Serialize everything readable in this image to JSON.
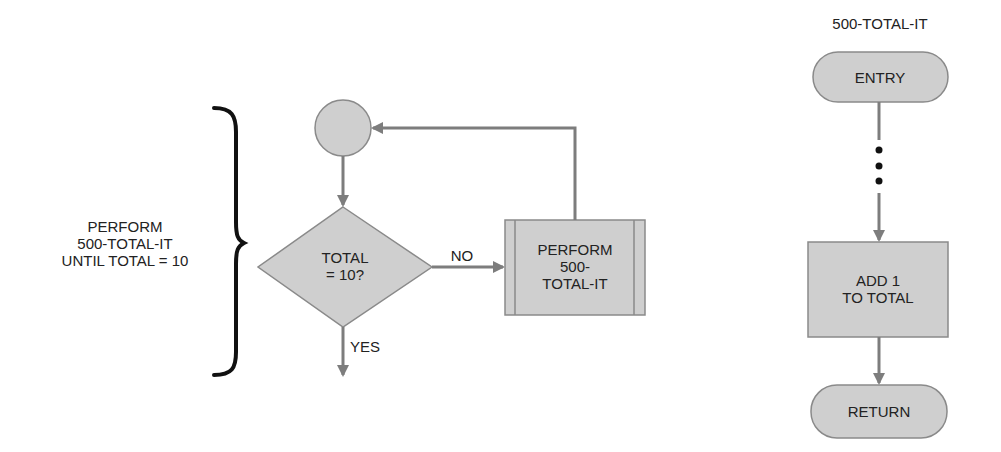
{
  "colors": {
    "shape_fill": "#cfcfcf",
    "shape_stroke": "#8a8a8a",
    "arrow": "#7d7d7d",
    "text": "#222222",
    "brace": "#111111"
  },
  "left_annotation": {
    "lines": [
      "PERFORM",
      "500-TOTAL-IT",
      "UNTIL TOTAL = 10"
    ]
  },
  "main_flow": {
    "start_connector": {
      "shape": "circle"
    },
    "decision": {
      "lines": [
        "TOTAL",
        "= 10?"
      ]
    },
    "no_label": "NO",
    "yes_label": "YES",
    "predefined_process": {
      "lines": [
        "PERFORM",
        "500-",
        "TOTAL-IT"
      ]
    }
  },
  "subroutine": {
    "title": "500-TOTAL-IT",
    "entry": "ENTRY",
    "ellipsis_dots": 3,
    "process": {
      "lines": [
        "ADD 1",
        "TO TOTAL"
      ]
    },
    "return": "RETURN"
  }
}
